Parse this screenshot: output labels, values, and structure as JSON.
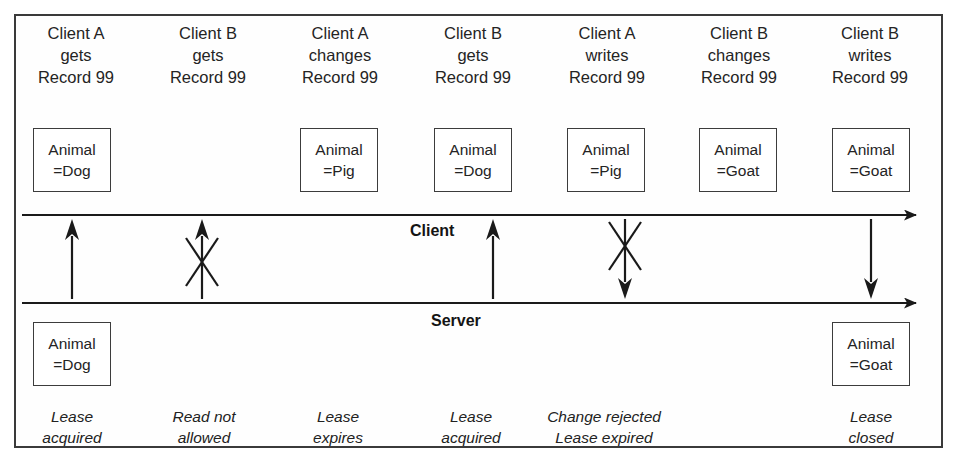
{
  "diagram": {
    "lanes": {
      "client_label": "Client",
      "server_label": "Server"
    },
    "colors": {
      "ink": "#1a1a1a",
      "frame": "#3a3a3a",
      "box_border": "#3c3c3c",
      "background": "#ffffff"
    },
    "columns": [
      {
        "id": "col-1",
        "header": [
          "Client A",
          "gets",
          "Record 99"
        ],
        "client_record": [
          "Animal",
          "=Dog"
        ],
        "server_record": [
          "Animal",
          "=Dog"
        ],
        "arrow": "up",
        "arrow_blocked": false,
        "caption": [
          "Lease",
          "acquired"
        ]
      },
      {
        "id": "col-2",
        "header": [
          "Client B",
          "gets",
          "Record 99"
        ],
        "client_record": null,
        "server_record": null,
        "arrow": "up",
        "arrow_blocked": true,
        "caption": [
          "Read not",
          "allowed"
        ]
      },
      {
        "id": "col-3",
        "header": [
          "Client A",
          "changes",
          "Record 99"
        ],
        "client_record": [
          "Animal",
          "=Pig"
        ],
        "server_record": null,
        "arrow": null,
        "arrow_blocked": false,
        "caption": [
          "Lease",
          "expires"
        ]
      },
      {
        "id": "col-4",
        "header": [
          "Client B",
          "gets",
          "Record 99"
        ],
        "client_record": [
          "Animal",
          "=Dog"
        ],
        "server_record": null,
        "arrow": "up",
        "arrow_blocked": false,
        "caption": [
          "Lease",
          "acquired"
        ]
      },
      {
        "id": "col-5",
        "header": [
          "Client A",
          "writes",
          "Record 99"
        ],
        "client_record": [
          "Animal",
          "=Pig"
        ],
        "server_record": null,
        "arrow": "down",
        "arrow_blocked": true,
        "caption": [
          "Change rejected",
          "Lease expired"
        ]
      },
      {
        "id": "col-6",
        "header": [
          "Client B",
          "changes",
          "Record 99"
        ],
        "client_record": [
          "Animal",
          "=Goat"
        ],
        "server_record": null,
        "arrow": null,
        "arrow_blocked": false,
        "caption": null
      },
      {
        "id": "col-7",
        "header": [
          "Client B",
          "writes",
          "Record 99"
        ],
        "client_record": [
          "Animal",
          "=Goat"
        ],
        "server_record": [
          "Animal",
          "=Goat"
        ],
        "arrow": "down",
        "arrow_blocked": false,
        "caption": [
          "Lease",
          "closed"
        ]
      }
    ]
  }
}
